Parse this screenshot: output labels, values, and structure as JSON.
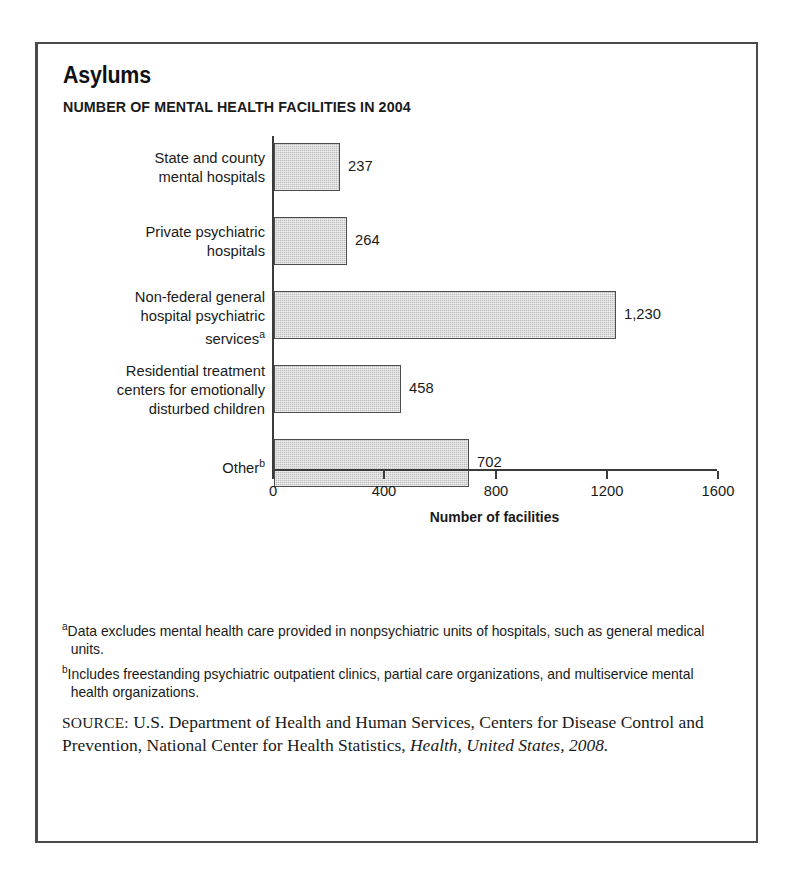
{
  "figure": {
    "title": "Asylums",
    "subtitle": "NUMBER OF MENTAL HEALTH FACILITIES IN 2004"
  },
  "chart_data": {
    "type": "bar",
    "orientation": "horizontal",
    "title": "Asylums",
    "subtitle": "NUMBER OF MENTAL HEALTH FACILITIES IN 2004",
    "xlabel": "Number of facilities",
    "ylabel": "",
    "xlim": [
      0,
      1600
    ],
    "xticks": [
      0,
      400,
      800,
      1200,
      1600
    ],
    "xtick_labels": [
      "0",
      "400",
      "800",
      "1200",
      "1600"
    ],
    "grid": false,
    "legend": null,
    "categories": [
      "State and county mental hospitals",
      "Private psychiatric hospitals",
      "Non-federal general hospital psychiatric services",
      "Residential treatment centers for emotionally disturbed children",
      "Other"
    ],
    "category_lines": [
      [
        "State and county",
        "mental hospitals"
      ],
      [
        "Private psychiatric",
        "hospitals"
      ],
      [
        "Non-federal general",
        "hospital psychiatric",
        "services"
      ],
      [
        "Residential treatment",
        "centers for emotionally",
        "disturbed children"
      ],
      [
        "Other"
      ]
    ],
    "category_footnote_markers": [
      "",
      "",
      "a",
      "",
      "b"
    ],
    "values": [
      237,
      264,
      1230,
      458,
      702
    ],
    "value_labels": [
      "237",
      "264",
      "1,230",
      "458",
      "702"
    ],
    "bar_fill_color": "#bdbdbd",
    "bar_border_color": "#4d4d4d"
  },
  "footnotes": [
    {
      "marker": "a",
      "text": "Data excludes mental health care provided in nonpsychiatric units of hospitals, such as general medical units."
    },
    {
      "marker": "b",
      "text": "Includes freestanding psychiatric outpatient clinics, partial care organizations, and multiservice mental health organizations."
    }
  ],
  "source": {
    "label": "SOURCE:",
    "text_before_italic": " U.S. Department of Health and Human Services, Centers for Disease Control and Prevention, National Center for Health Statistics, ",
    "italic_text": "Health, United States, 2008."
  }
}
